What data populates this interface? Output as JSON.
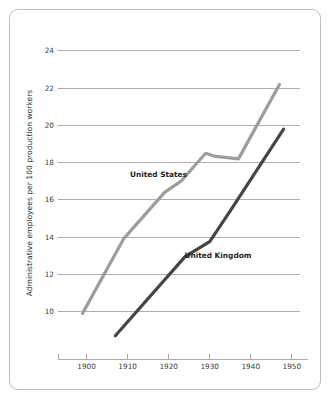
{
  "figure": {
    "background_color": "#ffffff",
    "frame_color": "#bdbdbd"
  },
  "chart_data": {
    "type": "line",
    "title": "",
    "subtitle": "",
    "xlabel": "",
    "ylabel": "Administrative employees per 100 production workers",
    "xlim": [
      1894,
      1952
    ],
    "ylim": [
      8.2,
      24.8
    ],
    "xticks": [
      1900,
      1910,
      1920,
      1930,
      1940,
      1950
    ],
    "xtick_labels": [
      "1900",
      "1910",
      "1920",
      "1930",
      "1940",
      "1950"
    ],
    "yticks": [
      10,
      12,
      14,
      16,
      18,
      20,
      22,
      24
    ],
    "ytick_labels": [
      "10",
      "12",
      "14",
      "16",
      "18",
      "20",
      "22",
      "24"
    ],
    "grid": "horizontal",
    "legend_position": "inline-annotation",
    "series": [
      {
        "name": "United States",
        "color": "#9d9d9d",
        "line_width": 3.2,
        "label_x": 1917.5,
        "label_y": 17.25,
        "x": [
          1899,
          1909,
          1919,
          1923,
          1929,
          1931,
          1937,
          1947
        ],
        "values": [
          9.9,
          13.9,
          16.4,
          17.0,
          18.5,
          18.35,
          18.2,
          22.2
        ]
      },
      {
        "name": "United Kingdom",
        "color": "#454545",
        "line_width": 3.2,
        "label_x": 1932.0,
        "label_y": 12.85,
        "x": [
          1907,
          1924,
          1930,
          1935,
          1948
        ],
        "values": [
          8.7,
          12.95,
          13.75,
          15.4,
          19.8
        ]
      }
    ]
  }
}
